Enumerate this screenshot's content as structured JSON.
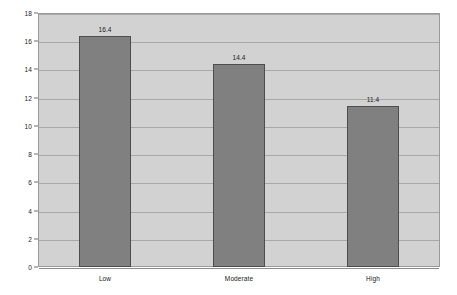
{
  "chart_data": {
    "type": "bar",
    "title": "",
    "subtitle": "",
    "xlabel": "",
    "ylabel": "",
    "categories": [
      "Low",
      "Moderate",
      "High"
    ],
    "values": [
      16.4,
      14.4,
      11.4
    ],
    "value_labels": [
      "16.4",
      "14.4",
      "11.4"
    ],
    "ylim": [
      0,
      18
    ],
    "ytick_labels": [
      "0",
      "2",
      "4",
      "6",
      "8",
      "10",
      "12",
      "14",
      "16",
      "18"
    ],
    "ytick_values": [
      0,
      2,
      4,
      6,
      8,
      10,
      12,
      14,
      16,
      18
    ],
    "grid": true,
    "legend": false,
    "legend_position": "none",
    "colors": {
      "bar_fill": "#808080",
      "bar_border": "#4d4d4d",
      "plot_background": "#d2d2d2",
      "page_background": "#ffffff",
      "gridline": "#a8a8a8",
      "frame": "#9a9a9a",
      "text": "#1a1a1a"
    }
  }
}
